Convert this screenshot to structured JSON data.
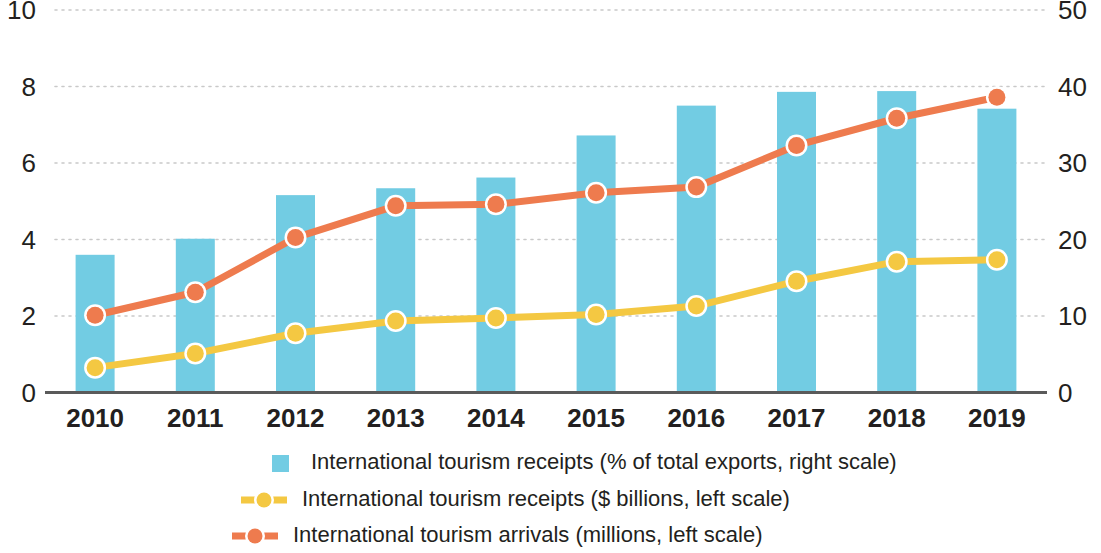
{
  "chart_data": {
    "type": "bar",
    "title": "",
    "subtitle": "",
    "xlabel": "",
    "ylabel": "",
    "categories": [
      "2010",
      "2011",
      "2012",
      "2013",
      "2014",
      "2015",
      "2016",
      "2017",
      "2018",
      "2019"
    ],
    "grid": true,
    "legend_position": "bottom",
    "axes": {
      "left": {
        "label": "",
        "ticks": [
          "0",
          "2",
          "4",
          "6",
          "8",
          "10"
        ],
        "values": [
          0,
          2,
          4,
          6,
          8,
          10
        ],
        "ylim": [
          0,
          10
        ]
      },
      "right": {
        "label": "",
        "ticks": [
          "0",
          "10",
          "20",
          "30",
          "40",
          "50"
        ],
        "values": [
          0,
          10,
          20,
          30,
          40,
          50
        ],
        "ylim": [
          0,
          50
        ]
      }
    },
    "series": [
      {
        "name": "International tourism receipts (% of total exports, right scale)",
        "type": "bar",
        "axis": "right",
        "color": "#72CCE3",
        "values": [
          18.0,
          20.1,
          25.8,
          26.7,
          28.1,
          33.6,
          37.5,
          39.3,
          39.4,
          37.1
        ],
        "values_left_scale": [
          3.6,
          4.02,
          5.15,
          5.33,
          5.62,
          6.71,
          7.49,
          7.86,
          7.88,
          7.42
        ]
      },
      {
        "name": "International tourism receipts ($ billions, left scale)",
        "type": "line",
        "axis": "left",
        "color": "#F4C842",
        "values": [
          0.65,
          1.02,
          1.55,
          1.87,
          1.95,
          2.04,
          2.26,
          2.91,
          3.42,
          3.47
        ]
      },
      {
        "name": "International tourism arrivals (millions, left scale)",
        "type": "line",
        "axis": "left",
        "color": "#EE7B4E",
        "values": [
          2.02,
          2.62,
          4.05,
          4.88,
          4.92,
          5.22,
          5.37,
          6.46,
          7.17,
          7.72
        ]
      }
    ]
  },
  "legend": {
    "items": [
      {
        "label": "International tourism receipts (% of total exports, right scale)",
        "marker": "square-swatch",
        "color": "#72CCE3"
      },
      {
        "label": "International tourism receipts ($ billions, left scale)",
        "marker": "line-dot-swatch",
        "color": "#F4C842"
      },
      {
        "label": "International tourism arrivals (millions, left scale)",
        "marker": "line-dot-swatch",
        "color": "#EE7B4E"
      }
    ]
  },
  "colors": {
    "bar": "#72CCE3",
    "receipts_line": "#F4C842",
    "arrivals_line": "#EE7B4E",
    "text": "#231f20",
    "gridline": "#c9c9c9",
    "axis": "#5a5a5a",
    "background": "#ffffff"
  }
}
